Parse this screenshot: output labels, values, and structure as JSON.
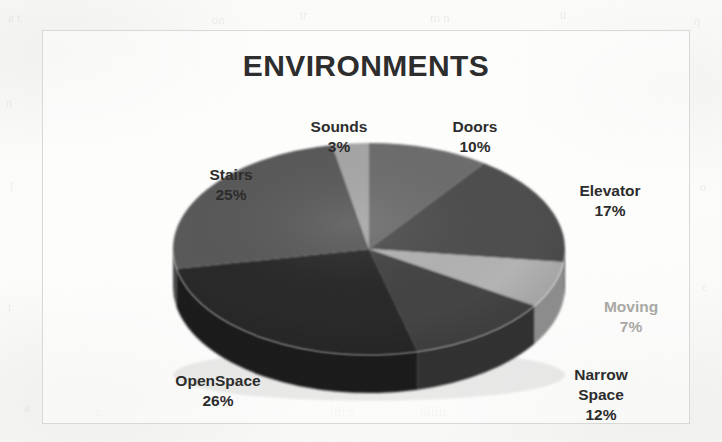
{
  "document": {
    "background_color": "#fdfdfc",
    "frame_border_color": "#d9d9d6"
  },
  "ghost_marks": [
    {
      "text": "a t",
      "left": 8,
      "top": 10,
      "size": 13
    },
    {
      "text": "on",
      "left": 212,
      "top": 12,
      "size": 13
    },
    {
      "text": "tr",
      "left": 300,
      "top": 8,
      "size": 12
    },
    {
      "text": "m n",
      "left": 430,
      "top": 10,
      "size": 13
    },
    {
      "text": "ti",
      "left": 560,
      "top": 8,
      "size": 12
    },
    {
      "text": "q",
      "left": 694,
      "top": 14,
      "size": 12
    },
    {
      "text": "n",
      "left": 6,
      "top": 96,
      "size": 12
    },
    {
      "text": "l",
      "left": 10,
      "top": 180,
      "size": 12
    },
    {
      "text": "t",
      "left": 8,
      "top": 300,
      "size": 12
    },
    {
      "text": "o",
      "left": 700,
      "top": 180,
      "size": 12
    },
    {
      "text": "e",
      "left": 702,
      "top": 280,
      "size": 12
    },
    {
      "text": "ith s",
      "left": 330,
      "top": 404,
      "size": 14
    },
    {
      "text": "ollin",
      "left": 420,
      "top": 404,
      "size": 14
    },
    {
      "text": "a",
      "left": 24,
      "top": 400,
      "size": 13
    },
    {
      "text": "n",
      "left": 96,
      "top": 404,
      "size": 13
    }
  ],
  "chart": {
    "title": "ENVIRONMENTS"
  },
  "chart_data": {
    "type": "pie",
    "title": "ENVIRONMENTS",
    "xlabel": "",
    "ylabel": "",
    "legend_position": "none",
    "grid": false,
    "labels_format": "name + percent",
    "style": "3d-exploded-disc grayscale scan",
    "categories": [
      "Doors",
      "Elevator",
      "Moving",
      "Narrow Space",
      "OpenSpace",
      "Stairs",
      "Sounds"
    ],
    "values": [
      10,
      17,
      7,
      12,
      26,
      25,
      3
    ],
    "slices": [
      {
        "name": "Doors",
        "percent": 10,
        "percent_text": "10%",
        "label": "Doors",
        "color": "#6e6e6e",
        "side_color": "#545454",
        "label_color": "#2d2d2d"
      },
      {
        "name": "Elevator",
        "percent": 17,
        "percent_text": "17%",
        "label": "Elevator",
        "color": "#4f4f4f",
        "side_color": "#3b3b3b",
        "label_color": "#2d2d2d"
      },
      {
        "name": "Moving",
        "percent": 7,
        "percent_text": "7%",
        "label": "Moving",
        "color": "#b4b4b4",
        "side_color": "#8d8d8d",
        "label_color": "#a9a9a6"
      },
      {
        "name": "Narrow Space",
        "percent": 12,
        "percent_text": "12%",
        "label": "Narrow Space",
        "label_line1": "Narrow",
        "label_line2": "Space",
        "color": "#454545",
        "side_color": "#323232",
        "label_color": "#2d2d2d"
      },
      {
        "name": "OpenSpace",
        "percent": 26,
        "percent_text": "26%",
        "label": "OpenSpace",
        "color": "#2a2a2a",
        "side_color": "#1d1d1d",
        "label_color": "#2d2d2d"
      },
      {
        "name": "Stairs",
        "percent": 25,
        "percent_text": "25%",
        "label": "Stairs",
        "color": "#5a5a5a",
        "side_color": "#454545",
        "label_color": "#2d2d2d"
      },
      {
        "name": "Sounds",
        "percent": 3,
        "percent_text": "3%",
        "label": "Sounds",
        "color": "#a8a8a8",
        "side_color": "#868686",
        "label_color": "#a9a9a6"
      }
    ]
  }
}
